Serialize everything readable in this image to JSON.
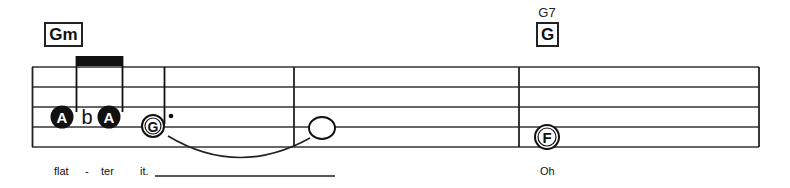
{
  "chords": [
    {
      "name": "",
      "box_label": "Gm"
    },
    {
      "name": "G7",
      "box_label": "G"
    }
  ],
  "notes": [
    {
      "letter": "A",
      "style": "filled",
      "duration": "eighth"
    },
    {
      "accidental": "b"
    },
    {
      "letter": "A",
      "style": "filled",
      "duration": "eighth"
    },
    {
      "letter": "G",
      "style": "open-dotted",
      "duration": "dotted-half"
    },
    {
      "letter": "",
      "style": "whole",
      "duration": "whole"
    },
    {
      "letter": "F",
      "style": "open",
      "duration": "half"
    }
  ],
  "lyrics": {
    "w1": "flat",
    "hyphen": "-",
    "w2": "ter",
    "w3": "it.",
    "w4": "Oh"
  }
}
